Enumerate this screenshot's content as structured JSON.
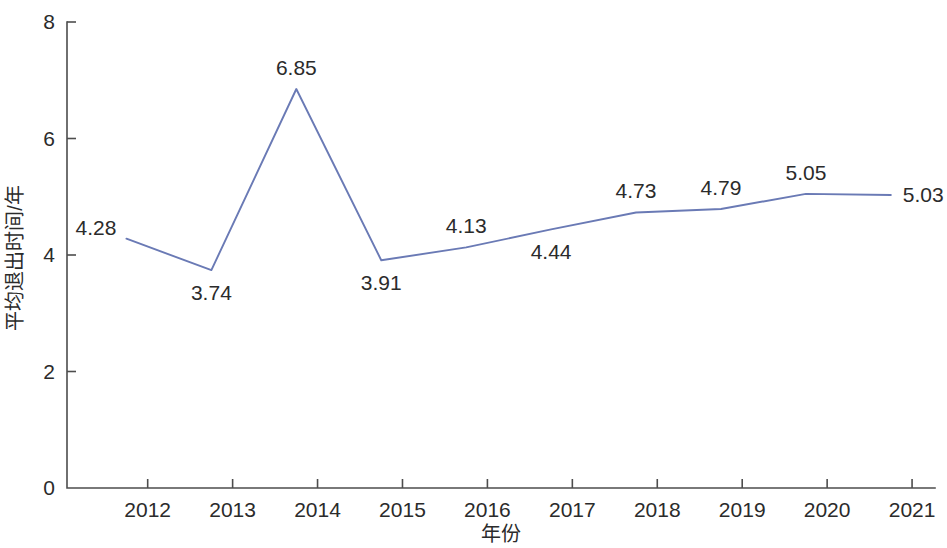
{
  "chart_data": {
    "type": "line",
    "title": "",
    "xlabel": "年份",
    "ylabel": "平均退出时间/年",
    "categories": [
      "2012",
      "2013",
      "2014",
      "2015",
      "2016",
      "2017",
      "2018",
      "2019",
      "2020",
      "2021"
    ],
    "values": [
      4.28,
      3.74,
      6.85,
      3.91,
      4.13,
      4.44,
      4.73,
      4.79,
      5.05,
      5.03
    ],
    "point_labels": [
      "4.28",
      "3.74",
      "6.85",
      "3.91",
      "4.13",
      "4.44",
      "4.73",
      "4.79",
      "5.05",
      "5.03"
    ],
    "series": [
      {
        "name": "平均退出时间/年",
        "values": [
          4.28,
          3.74,
          6.85,
          3.91,
          4.13,
          4.44,
          4.73,
          4.79,
          5.05,
          5.03
        ]
      }
    ],
    "ylim": [
      0,
      8
    ],
    "y_ticks": [
      "0",
      "2",
      "4",
      "6",
      "8"
    ],
    "y_tick_values": [
      0,
      2,
      4,
      6,
      8
    ],
    "x_ticks": [
      "2012",
      "2013",
      "2014",
      "2015",
      "2016",
      "2017",
      "2018",
      "2019",
      "2020",
      "2021"
    ],
    "grid": false,
    "legend": false,
    "line_color": "#6a7ab5",
    "axis_color": "#4d4d4d",
    "text_color": "#2b2b2b",
    "background": "#ffffff",
    "label_positions": [
      "above-left",
      "below",
      "above",
      "below",
      "above",
      "below",
      "above",
      "above",
      "above",
      "right"
    ]
  }
}
